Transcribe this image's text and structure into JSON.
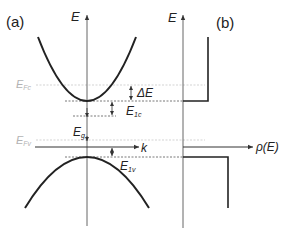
{
  "panel_a": {
    "label": "(a)",
    "y_axis_label": "E",
    "x_axis_label": "k",
    "fermi_conduction": {
      "main": "E",
      "sub": "Fc"
    },
    "fermi_valence": {
      "main": "E",
      "sub": "Fv"
    },
    "delta_e": "ΔE",
    "e1c": {
      "main": "E",
      "sub": "1c"
    },
    "e1v": {
      "main": "E",
      "sub": "1v"
    },
    "eg": {
      "main": "E",
      "sub": "g"
    }
  },
  "panel_b": {
    "label": "(b)",
    "y_axis_label": "E",
    "x_axis_label": "ρ(E)"
  },
  "colors": {
    "curve": "#222222",
    "axis": "#555555",
    "fermi_line": "#c8c8c8",
    "dashed_line": "#555555",
    "fermi_label": "#b3b3b3"
  }
}
